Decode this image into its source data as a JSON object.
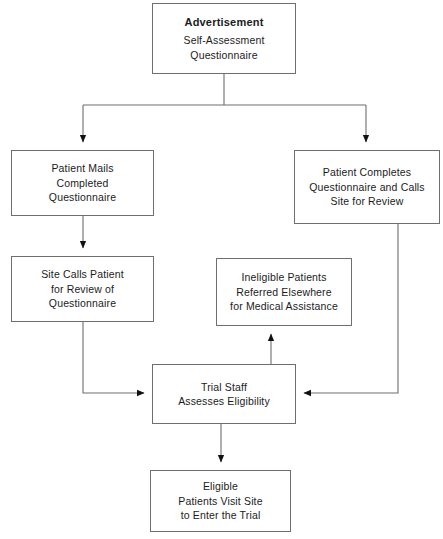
{
  "diagram": {
    "line_color": "#6e6e70",
    "text_color": "#1b1b1d",
    "background_color": "#ffffff",
    "nodes": [
      {
        "id": "advertisement",
        "heading": "Advertisement",
        "lines": [
          "Self-Assessment",
          "Questionnaire"
        ]
      },
      {
        "id": "patient_mails",
        "heading": "",
        "lines": [
          "Patient Mails",
          "Completed",
          "Questionnaire"
        ]
      },
      {
        "id": "patient_completes",
        "heading": "",
        "lines": [
          "Patient Completes",
          "Questionnaire and Calls",
          "Site for Review"
        ]
      },
      {
        "id": "site_calls",
        "heading": "",
        "lines": [
          "Site Calls Patient",
          "for Review of",
          "Questionnaire"
        ]
      },
      {
        "id": "ineligible",
        "heading": "",
        "lines": [
          "Ineligible Patients",
          "Referred Elsewhere",
          "for Medical Assistance"
        ]
      },
      {
        "id": "trial_staff",
        "heading": "",
        "lines": [
          "Trial Staff",
          "Assesses Eligibility"
        ]
      },
      {
        "id": "eligible",
        "heading": "",
        "lines": [
          "Eligible",
          "Patients Visit Site",
          "to Enter the Trial"
        ]
      }
    ],
    "edges": [
      {
        "from": "advertisement",
        "to": "patient_mails",
        "kind": "split-left"
      },
      {
        "from": "advertisement",
        "to": "patient_completes",
        "kind": "split-right"
      },
      {
        "from": "patient_mails",
        "to": "site_calls",
        "kind": "straight-down"
      },
      {
        "from": "site_calls",
        "to": "trial_staff",
        "kind": "elbow-down-right"
      },
      {
        "from": "patient_completes",
        "to": "trial_staff",
        "kind": "elbow-down-left"
      },
      {
        "from": "trial_staff",
        "to": "ineligible",
        "kind": "straight-up"
      },
      {
        "from": "trial_staff",
        "to": "eligible",
        "kind": "straight-down"
      }
    ]
  }
}
